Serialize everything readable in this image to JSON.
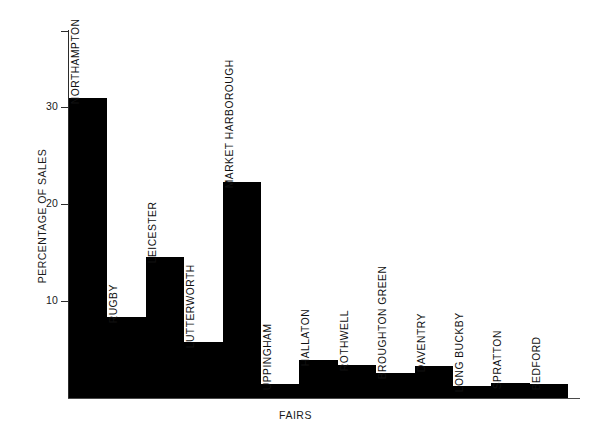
{
  "chart_data": {
    "type": "bar",
    "title": "",
    "xlabel": "FAIRS",
    "ylabel": "PERCENTAGE OF SALES",
    "ylim": [
      0,
      38
    ],
    "ytick_values": [
      10,
      20,
      30
    ],
    "ytick_labels": [
      "10",
      "20",
      "30"
    ],
    "grid": false,
    "legend": null,
    "bar_color": "#000000",
    "axis_color": "#2b2b2b",
    "categories": [
      "NORTHAMPTON",
      "RUGBY",
      "LEICESTER",
      "LUTTERWORTH",
      "MARKET HARBOROUGH",
      "UPPINGHAM",
      "HALLATON",
      "ROTHWELL",
      "BROUGHTON GREEN",
      "DAVENTRY",
      "LONG BUCKBY",
      "SPRATTON",
      "BEDFORD"
    ],
    "values": [
      31.0,
      8.4,
      14.6,
      5.8,
      22.3,
      1.4,
      3.9,
      3.4,
      2.6,
      3.3,
      1.2,
      1.6,
      1.4
    ]
  },
  "axes": {
    "y_title": "PERCENTAGE OF SALES",
    "x_title": "FAIRS",
    "y_ticks": [
      {
        "label": "30",
        "value": 30
      },
      {
        "label": "20",
        "value": 20
      },
      {
        "label": "10",
        "value": 10
      }
    ]
  },
  "bars": [
    {
      "label": "NORTHAMPTON",
      "value": 31.0
    },
    {
      "label": "RUGBY",
      "value": 8.4
    },
    {
      "label": "LEICESTER",
      "value": 14.6
    },
    {
      "label": "LUTTERWORTH",
      "value": 5.8
    },
    {
      "label": "MARKET HARBOROUGH",
      "value": 22.3
    },
    {
      "label": "UPPINGHAM",
      "value": 1.4
    },
    {
      "label": "HALLATON",
      "value": 3.9
    },
    {
      "label": "ROTHWELL",
      "value": 3.4
    },
    {
      "label": "BROUGHTON GREEN",
      "value": 2.6
    },
    {
      "label": "DAVENTRY",
      "value": 3.3
    },
    {
      "label": "LONG BUCKBY",
      "value": 1.2
    },
    {
      "label": "SPRATTON",
      "value": 1.6
    },
    {
      "label": "BEDFORD",
      "value": 1.4
    }
  ]
}
